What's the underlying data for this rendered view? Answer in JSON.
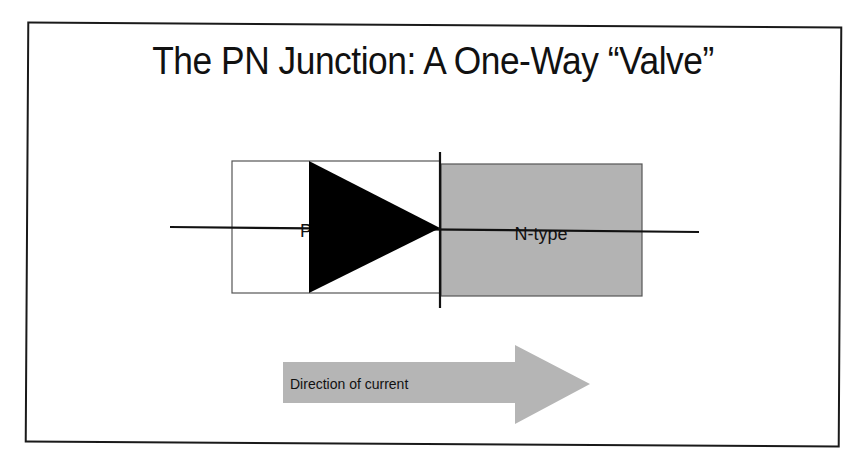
{
  "slide": {
    "title": "The PN Junction: A One-Way “Valve”"
  },
  "diagram": {
    "p_region": {
      "label": "P-type",
      "fill": "#ffffff",
      "stroke": "#555555"
    },
    "n_region": {
      "label": "N-type",
      "fill": "#b3b3b3",
      "stroke": "#555555"
    },
    "diode_symbol": {
      "anode_fill": "#000000",
      "cathode_bar_color": "#111111",
      "wire_color": "#111111"
    },
    "current_arrow": {
      "label": "Direction of current",
      "fill": "#b5b5b5",
      "text_color": "#111111"
    }
  }
}
